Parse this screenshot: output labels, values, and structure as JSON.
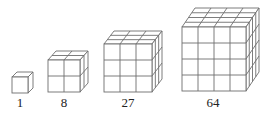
{
  "figure": {
    "line_color": "#6e6e6e",
    "cubes": [
      {
        "n": 1,
        "label": "1",
        "x": 12,
        "y": 77,
        "size": 16,
        "dx": 5,
        "dy": 5,
        "label_x": 20
      },
      {
        "n": 2,
        "label": "8",
        "x": 48,
        "y": 60,
        "size": 32,
        "dx": 8,
        "dy": 9,
        "label_x": 64
      },
      {
        "n": 3,
        "label": "27",
        "x": 104,
        "y": 44,
        "size": 48,
        "dx": 10,
        "dy": 13,
        "label_x": 128
      },
      {
        "n": 4,
        "label": "64",
        "x": 182,
        "y": 27,
        "size": 64,
        "dx": 13,
        "dy": 19,
        "label_x": 213
      }
    ]
  }
}
